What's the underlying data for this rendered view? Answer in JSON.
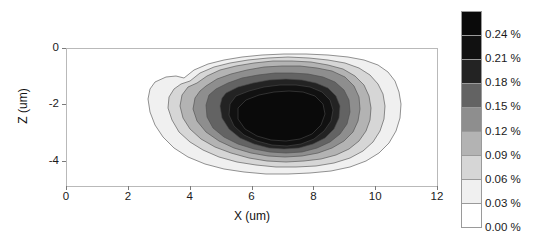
{
  "chart_data": {
    "type": "heatmap",
    "subtype": "filled-contour",
    "title": "",
    "xlabel": "X (um)",
    "ylabel": "Z (um)",
    "xlim": [
      0,
      12
    ],
    "ylim": [
      -4.9,
      0
    ],
    "xticks": [
      0,
      2,
      4,
      6,
      8,
      10,
      12
    ],
    "xticklabels": [
      "0",
      "2",
      "4",
      "6",
      "8",
      "10",
      "12"
    ],
    "yticks": [
      0,
      -2,
      -4
    ],
    "yticklabels": [
      "0",
      "-2",
      "-4"
    ],
    "grid": false,
    "legend": "colorbar-right",
    "colorbar": {
      "units": "%",
      "ticklabels": [
        "0.24 %",
        "0.21 %",
        "0.18 %",
        "0.15 %",
        "0.12 %",
        "0.09 %",
        "0.06 %",
        "0.03 %",
        "0.00 %"
      ],
      "tickvalues": [
        0.24,
        0.21,
        0.18,
        0.15,
        0.12,
        0.09,
        0.06,
        0.03,
        0.0
      ],
      "vmin": 0.0,
      "vmax": 0.27,
      "band_colors": [
        "#0a0a0a",
        "#111111",
        "#232323",
        "#636363",
        "#8e8e8e",
        "#b3b3b3",
        "#d6d6d6",
        "#f0f0f0",
        "#ffffff"
      ],
      "band_ranges": [
        "0.24 - 0.27",
        "0.21 - 0.24",
        "0.18 - 0.21",
        "0.15 - 0.18",
        "0.12 - 0.15",
        "0.09 - 0.12",
        "0.06 - 0.09",
        "0.03 - 0.06",
        "0.00 - 0.03"
      ]
    },
    "contour_levels": [
      0.03,
      0.06,
      0.09,
      0.12,
      0.15,
      0.18,
      0.21,
      0.24
    ],
    "peak": {
      "x": 6.0,
      "z": -2.0,
      "value": 0.24
    },
    "extent_of_plume": {
      "x_min": 3.0,
      "x_max": 10.6,
      "z_min": -4.4,
      "z_max": -0.3
    },
    "contours": [
      {
        "level": 0.03,
        "color": "#f0f0f0",
        "points": "118,30 128,22 142,16 158,12 176,9 196,7 218,6 240,6 262,7 282,9 298,12 312,17 322,24 329,33 333,44 335,56 334,70 330,83 323,95 313,105 300,113 284,119 265,123 244,125 222,126 200,126 178,124 158,121 139,116 122,109 108,100 97,89 89,77 84,64 82,51 84,41 89,34 100,29 110,28"
      },
      {
        "level": 0.06,
        "color": "#d6d6d6",
        "points": "124,33 134,25 148,19 164,15 182,12 202,10 222,9 243,10 262,12 279,15 293,20 304,27 312,36 317,46 319,58 318,71 314,83 307,94 297,103 284,110 268,115 250,118 230,119 210,119 190,117 171,114 153,109 137,102 124,94 113,84 106,72 102,60 103,49 108,41 115,36"
      },
      {
        "level": 0.09,
        "color": "#b3b3b3",
        "points": "131,35 141,28 154,22 170,18 188,15 207,13 226,13 245,14 262,17 277,21 289,28 298,37 303,48 305,60 304,72 300,83 293,93 283,101 270,107 255,111 238,113 220,114 201,113 183,110 165,105 149,99 135,91 124,81 117,70 114,58 116,47 122,39"
      },
      {
        "level": 0.12,
        "color": "#8e8e8e",
        "points": "140,38 151,31 165,26 181,22 198,19 216,18 234,18 251,20 266,23 279,29 288,38 293,49 294,61 292,73 287,84 278,93 266,100 252,105 236,108 219,109 202,108 185,105 168,100 153,93 140,84 131,73 127,61 129,50 134,43"
      },
      {
        "level": 0.15,
        "color": "#636363",
        "points": "150,41 162,35 176,30 192,27 209,25 226,25 242,26 257,29 269,34 278,42 283,52 284,64 281,76 274,86 264,94 251,100 236,104 220,105 204,104 188,101 172,96 158,89 147,80 141,69 140,57 143,47"
      },
      {
        "level": 0.18,
        "color": "#232323",
        "points": "160,45 172,39 187,35 203,32 220,31 236,32 250,35 262,40 270,48 274,58 273,70 268,81 259,90 247,96 233,100 218,101 203,100 188,96 174,90 163,81 156,70 154,58 156,50"
      },
      {
        "level": 0.21,
        "color": "#111111",
        "points": "170,48 183,43 198,39 214,37 230,37 244,39 256,44 264,52 267,62 265,73 258,83 248,91 235,96 221,98 206,97 191,93 178,87 168,78 163,67 164,56"
      },
      {
        "level": 0.24,
        "color": "#0a0a0a",
        "points": "180,52 193,47 208,44 223,43 237,44 249,48 257,56 259,66 255,77 246,86 234,91 220,93 205,92 191,88 179,81 172,71 172,60"
      }
    ]
  },
  "axes": {
    "x_title": "X (um)",
    "y_title": "Z (um)"
  }
}
